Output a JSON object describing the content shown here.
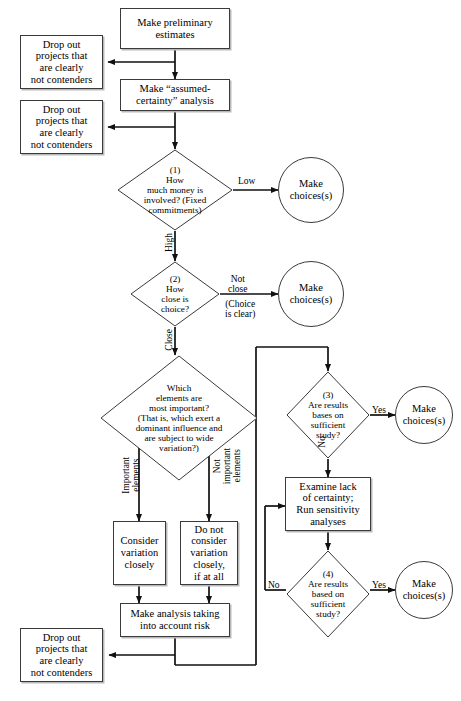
{
  "diagram": {
    "type": "flowchart",
    "stroke_color": "#3a3a3a",
    "background": "#ffffff"
  },
  "nodes": {
    "preliminary": {
      "label": "Make preliminary\nestimates",
      "shape": "process"
    },
    "dropout_1": {
      "label": "Drop out\nprojects that\nare clearly\nnot contenders",
      "shape": "process"
    },
    "assumed_certainty": {
      "label": "Make “assumed-\ncertainty” analysis",
      "shape": "process"
    },
    "dropout_2": {
      "label": "Drop out\nprojects that\nare clearly\nnot contenders",
      "shape": "process"
    },
    "decision_1": {
      "label": "(1)\nHow\nmuch money is\ninvolved? (Fixed\ncommitments)",
      "shape": "decision"
    },
    "choices_1": {
      "label": "Make\nchoices(s)",
      "shape": "terminal"
    },
    "decision_2": {
      "label": "(2)\nHow\nclose is\nchoice?",
      "shape": "decision"
    },
    "choices_2": {
      "label": "Make\nchoices(s)",
      "shape": "terminal"
    },
    "decision_elements": {
      "label": "Which\nelements are\nmost important?\n(That is, which exert a\ndominant influence and\nare subject to wide\nvariation?)",
      "shape": "decision"
    },
    "consider_variation": {
      "label": "Consider\nvariation\nclosely",
      "shape": "process"
    },
    "do_not_consider": {
      "label": "Do not\nconsider\nvariation\nclosely,\nif at all",
      "shape": "process"
    },
    "make_analysis_risk": {
      "label": "Make analysis taking\ninto account risk",
      "shape": "process"
    },
    "dropout_3": {
      "label": "Drop out\nprojects that\nare clearly\nnot contenders",
      "shape": "process"
    },
    "decision_3": {
      "label": "(3)\nAre results\nbases on\nsufficient\nstudy?",
      "shape": "decision"
    },
    "choices_3": {
      "label": "Make\nchoices(s)",
      "shape": "terminal"
    },
    "examine_lack": {
      "label": "Examine lack\nof certainty;\nRun sensitivity\nanalyses",
      "shape": "process"
    },
    "decision_4": {
      "label": "(4)\nAre results\nbased on\nsufficient\nstudy?",
      "shape": "decision"
    },
    "choices_4": {
      "label": "Make\nchoices(s)",
      "shape": "terminal"
    }
  },
  "edge_labels": {
    "low": "Low",
    "high": "High",
    "not_close": "Not\nclose",
    "choice_is_clear": "(Choice\nis clear)",
    "close": "Close",
    "important_elements": "Important\nelements",
    "not_important_elements": "Not\nimportant\nelements",
    "yes_3": "Yes",
    "no_3": "No",
    "yes_4": "Yes",
    "no_4": "No"
  }
}
